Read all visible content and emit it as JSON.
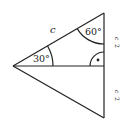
{
  "diagram": {
    "type": "geometry-triangle",
    "labels": {
      "hypotenuse": "c",
      "top_angle": "60°",
      "left_angle": "30°",
      "upper_half": "c/2",
      "lower_half": "c/2",
      "half_numerator": "c",
      "half_denominator": "2"
    },
    "colors": {
      "stroke": "#222222",
      "background": "#ffffff"
    }
  }
}
